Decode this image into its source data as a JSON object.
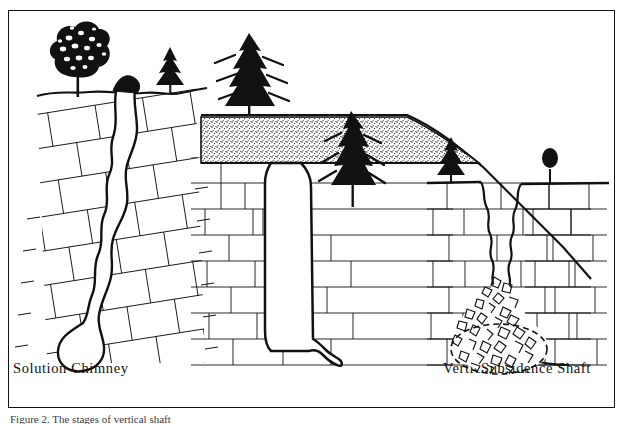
{
  "figure": {
    "type": "line-diagram",
    "background": "#ffffff",
    "ink": "#111111",
    "border": true,
    "caption": "Figure 2.  The stages of vertical shaft",
    "caption_truncated": true
  },
  "panels": [
    {
      "id": "solution-chimney",
      "label": "Solution Chimney",
      "label_x": 12,
      "rock_structure": "tilted bedded limestone",
      "bedding_dip_deg": 12,
      "void_shape": "sinuous narrow crack widening to bulbous cavity at depth",
      "surface_features": [
        "broadleaf tree",
        "small conifer",
        "depression at crack mouth"
      ],
      "soil_layer": false
    },
    {
      "id": "vertical-shaft",
      "label": "Vertical Shaft",
      "label_x": 262,
      "rock_structure": "horizontal bedded limestone",
      "bedding_dip_deg": 0,
      "void_shape": "straight-walled vertical shaft with small drain tube at base",
      "surface_features": [
        "conifer on upland",
        "conifer on slope"
      ],
      "soil_layer": true,
      "soil_pattern": "stippled residual soil"
    },
    {
      "id": "subsidence-shaft",
      "label": "Subsidence Shaft",
      "label_x": 482,
      "rock_structure": "horizontal bedded limestone",
      "bedding_dip_deg": 0,
      "void_shape": "wide ragged-walled shaft filled at base by breakdown rubble cone",
      "surface_features": [
        "small conifer",
        "small round tree"
      ],
      "soil_layer": false,
      "rubble": true,
      "rubble_outline": "dashed ellipse"
    }
  ],
  "labels": {
    "left": "Solution Chimney",
    "middle": "Vertical Shaft",
    "right": "Subsidence Shaft"
  }
}
